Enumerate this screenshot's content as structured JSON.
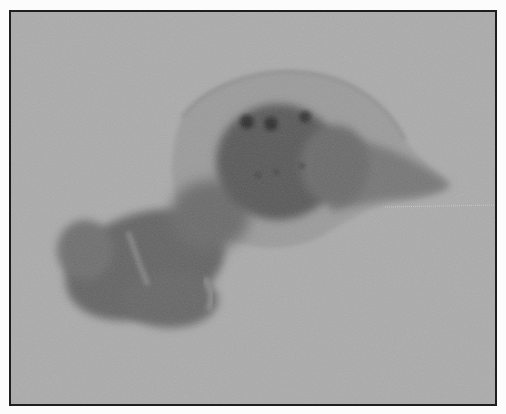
{
  "image": {
    "kind": "grayscale specimen photograph",
    "alt": "Grayscale photograph of a gross tissue specimen: a translucent membranous sac containing a dark ovoid mass with three dark spots, a dark lobulated mass to the lower left, and a tapered tail to the right, on a plain gray background inside a black frame.",
    "colors": {
      "frame_border": "#1e1e1e",
      "background": "#ababab",
      "membrane": "#9a9a9a",
      "central_mass": "#585858",
      "left_lobe": "#626262",
      "spots": "#2e2e2e",
      "tail": "#7a7a7a"
    }
  }
}
